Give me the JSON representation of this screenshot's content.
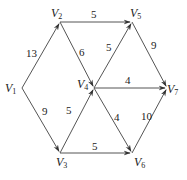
{
  "graph": {
    "nodes": [
      {
        "id": "V1",
        "label": "V",
        "sub": "1",
        "x": 22,
        "y": 88,
        "lx": 5,
        "ly": 92
      },
      {
        "id": "V2",
        "label": "V",
        "sub": "2",
        "x": 60,
        "y": 22,
        "lx": 51,
        "ly": 17
      },
      {
        "id": "V3",
        "label": "V",
        "sub": "3",
        "x": 60,
        "y": 153,
        "lx": 56,
        "ly": 166
      },
      {
        "id": "V4",
        "label": "V",
        "sub": "4",
        "x": 94,
        "y": 88,
        "lx": 77,
        "ly": 88
      },
      {
        "id": "V5",
        "label": "V",
        "sub": "5",
        "x": 132,
        "y": 22,
        "lx": 130,
        "ly": 17
      },
      {
        "id": "V6",
        "label": "V",
        "sub": "6",
        "x": 132,
        "y": 153,
        "lx": 134,
        "ly": 166
      },
      {
        "id": "V7",
        "label": "V",
        "sub": "7",
        "x": 167,
        "y": 88,
        "lx": 167,
        "ly": 93
      }
    ],
    "edges": [
      {
        "from": "V1",
        "to": "V2",
        "weight": "13",
        "lx": 26,
        "ly": 57
      },
      {
        "from": "V1",
        "to": "V3",
        "weight": "9",
        "lx": 42,
        "ly": 115
      },
      {
        "from": "V2",
        "to": "V5",
        "weight": "5",
        "lx": 91,
        "ly": 18
      },
      {
        "from": "V2",
        "to": "V4",
        "weight": "6",
        "lx": 79,
        "ly": 56
      },
      {
        "from": "V3",
        "to": "V4",
        "weight": "5",
        "lx": 66,
        "ly": 114
      },
      {
        "from": "V4",
        "to": "V5",
        "weight": "5",
        "lx": 106,
        "ly": 51
      },
      {
        "from": "V4",
        "to": "V7",
        "weight": "4",
        "lx": 125,
        "ly": 84
      },
      {
        "from": "V4",
        "to": "V6",
        "weight": "4",
        "lx": 114,
        "ly": 121
      },
      {
        "from": "V5",
        "to": "V7",
        "weight": "9",
        "lx": 151,
        "ly": 49
      },
      {
        "from": "V3",
        "to": "V6",
        "weight": "5",
        "lx": 92,
        "ly": 150
      },
      {
        "from": "V6",
        "to": "V7",
        "weight": "10",
        "lx": 141,
        "ly": 120
      }
    ]
  }
}
